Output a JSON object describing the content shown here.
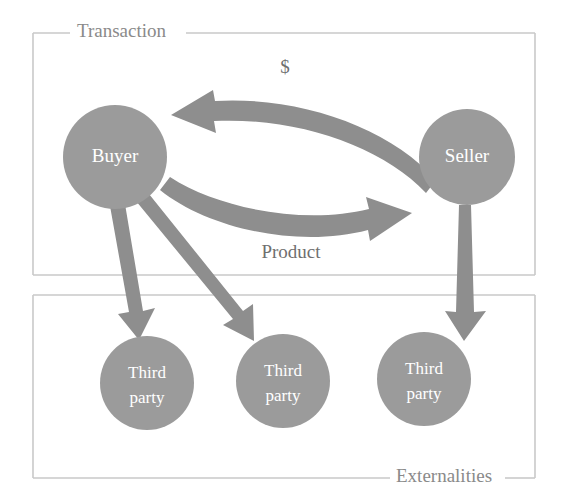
{
  "diagram": {
    "colors": {
      "node_fill": "#9b9b9b",
      "node_text": "#ffffff",
      "arrow": "#8e8e8e",
      "frame": "#c9c9c9",
      "label_text": "#8a8a8a",
      "background": "#ffffff"
    },
    "groups": [
      {
        "id": "transaction",
        "label": "Transaction",
        "label_position": "top-left",
        "x": 33,
        "y": 33,
        "width": 502,
        "height": 242
      },
      {
        "id": "externalities",
        "label": "Externalities",
        "label_position": "bottom-right",
        "x": 33,
        "y": 295,
        "width": 502,
        "height": 183
      }
    ],
    "nodes": [
      {
        "id": "buyer",
        "label": "Buyer",
        "line1": "Buyer",
        "line2": "",
        "cx": 115,
        "cy": 157,
        "r": 52,
        "group": "transaction"
      },
      {
        "id": "seller",
        "label": "Seller",
        "line1": "Seller",
        "line2": "",
        "cx": 467,
        "cy": 157,
        "r": 48,
        "group": "transaction"
      },
      {
        "id": "third-party-1",
        "label": "Third party",
        "line1": "Third",
        "line2": "party",
        "cx": 147,
        "cy": 383,
        "r": 47,
        "group": "externalities"
      },
      {
        "id": "third-party-2",
        "label": "Third party",
        "line1": "Third",
        "line2": "party",
        "cx": 283,
        "cy": 381,
        "r": 47,
        "group": "externalities"
      },
      {
        "id": "third-party-3",
        "label": "Third party",
        "line1": "Third",
        "line2": "party",
        "cx": 424,
        "cy": 379,
        "r": 47,
        "group": "externalities"
      }
    ],
    "edges": [
      {
        "id": "money-flow",
        "label": "$",
        "from": "seller",
        "to": "buyer",
        "style": "curved",
        "label_x": 285,
        "label_y": 69
      },
      {
        "id": "product-flow",
        "label": "Product",
        "from": "buyer",
        "to": "seller",
        "style": "curved",
        "label_x": 291,
        "label_y": 254
      },
      {
        "id": "spillover-1",
        "label": "",
        "from": "buyer",
        "to": "third-party-1",
        "style": "straight"
      },
      {
        "id": "spillover-2",
        "label": "",
        "from": "buyer",
        "to": "third-party-2",
        "style": "straight"
      },
      {
        "id": "spillover-3",
        "label": "",
        "from": "seller",
        "to": "third-party-3",
        "style": "straight"
      }
    ]
  }
}
